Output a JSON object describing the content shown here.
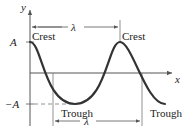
{
  "diagram": {
    "type": "sinusoidal-wave",
    "axes": {
      "x_label": "x",
      "y_label": "y"
    },
    "amplitude_labels": {
      "positive": "A",
      "negative": "−A"
    },
    "annotations": {
      "crest_left": "Crest",
      "crest_right": "Crest",
      "trough_left": "Trough",
      "trough_right": "Trough",
      "wavelength_top": "λ",
      "wavelength_bottom": "λ"
    },
    "colors": {
      "wave": "#333333",
      "axes": "#555555",
      "guides": "#777777",
      "text": "#222222"
    }
  }
}
